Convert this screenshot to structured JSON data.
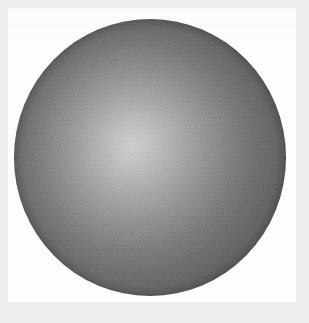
{
  "figure": {
    "description": "Grayscale rendering of a diffusely lit sphere on a white background",
    "caption": "",
    "medium": "scanned halftone print",
    "background_color": "#fdfdfd",
    "frame_color": "#ededee"
  },
  "chart_data": {
    "type": "scatter",
    "subtitle": "",
    "xlabel": "",
    "ylabel": "",
    "grid": false,
    "legend_position": "none",
    "xlim": [
      0,
      309
    ],
    "ylim": [
      0,
      323
    ],
    "annotations": [],
    "objects": [
      {
        "name": "sphere",
        "shape": "circle",
        "center_x": 150,
        "center_y": 157,
        "radius_x": 136,
        "radius_y": 138,
        "bounds": {
          "left": 14,
          "top": 19,
          "right": 286,
          "bottom": 296
        },
        "shading": "radial diffuse falloff",
        "highlight_x_pct": 43,
        "highlight_y_pct": 45,
        "highlight_color": "#cacaca",
        "midtone_color": "#686868",
        "terminator_color": "#4c4c4c",
        "rim_color": "#3a3a3a",
        "grain": true
      }
    ],
    "canvas": {
      "panel_left": 8,
      "panel_top": 8,
      "panel_width": 288,
      "panel_height": 294,
      "panel_color": "#fdfdfd",
      "frame_color": "#ededee"
    }
  }
}
